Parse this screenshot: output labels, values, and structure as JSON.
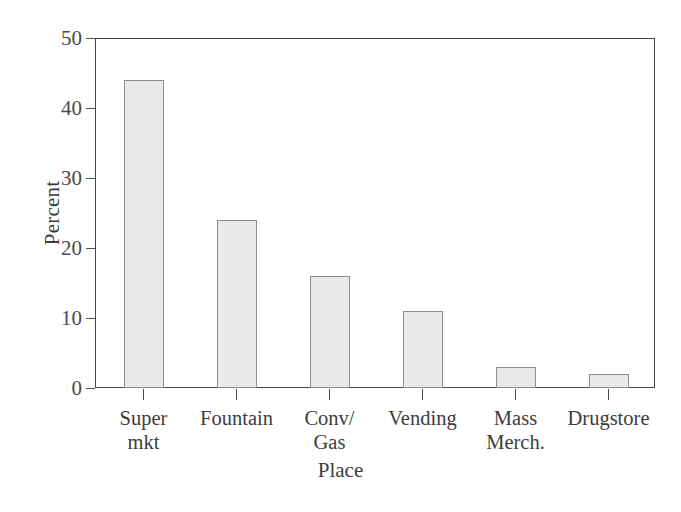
{
  "chart_data": {
    "type": "bar",
    "title": "",
    "xlabel": "Place",
    "ylabel": "Percent",
    "categories": [
      "Super mkt",
      "Fountain",
      "Conv/ Gas",
      "Vending",
      "Mass Merch.",
      "Drugstore"
    ],
    "category_lines": [
      [
        "Super",
        "mkt"
      ],
      [
        "Fountain",
        ""
      ],
      [
        "Conv/",
        "Gas"
      ],
      [
        "Vending",
        ""
      ],
      [
        "Mass",
        "Merch."
      ],
      [
        "Drugstore",
        ""
      ]
    ],
    "values": [
      44,
      24,
      16,
      11,
      3,
      2
    ],
    "ylim": [
      0,
      50
    ],
    "yticks": [
      0,
      10,
      20,
      30,
      40,
      50
    ],
    "ytick_labels": [
      "0",
      "10",
      "20",
      "30",
      "40",
      "50"
    ],
    "grid": false,
    "legend": "none",
    "bar_fill_color": "#e9e9e9",
    "bar_border_color": "#8d8d8d",
    "frame_color": "#46464a",
    "text_color": "#3d3d3d"
  }
}
